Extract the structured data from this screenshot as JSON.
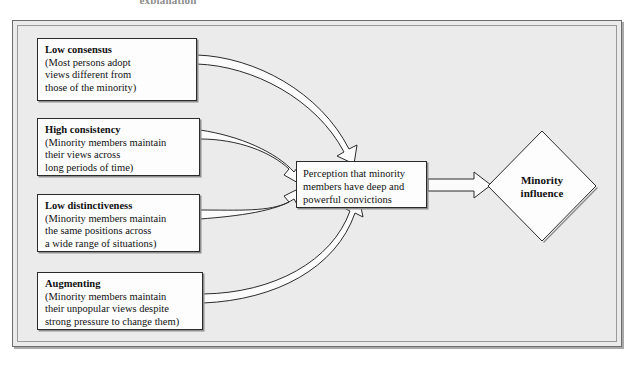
{
  "caption_fragment": "explanation",
  "colors": {
    "panel_background": "#ebebeb",
    "box_fill": "#fdfdfd",
    "stroke": "#2b2b2b",
    "page_background": "#ffffff"
  },
  "diagram": {
    "type": "flow-diagram",
    "antecedent_boxes": [
      {
        "name": "low-consensus",
        "title": "Low consensus",
        "lines": [
          "(Most persons adopt",
          "views different from",
          "those of the minority)"
        ]
      },
      {
        "name": "high-consistency",
        "title": "High consistency",
        "lines": [
          "(Minority members maintain",
          "their views across",
          "long periods of time)"
        ]
      },
      {
        "name": "low-distinctiveness",
        "title": "Low distinctiveness",
        "lines": [
          "(Minority members maintain",
          "the same positions across",
          "a wide range of situations)"
        ]
      },
      {
        "name": "augmenting",
        "title": "Augmenting",
        "lines": [
          "(Minority members maintain",
          "their unpopular views despite",
          "strong pressure to change them)"
        ]
      }
    ],
    "mediator": {
      "name": "perception",
      "lines": [
        "Perception that minority",
        "members have deep and",
        "powerful convictions"
      ]
    },
    "outcome": {
      "name": "minority-influence",
      "lines": [
        "Minority",
        "influence"
      ]
    }
  }
}
